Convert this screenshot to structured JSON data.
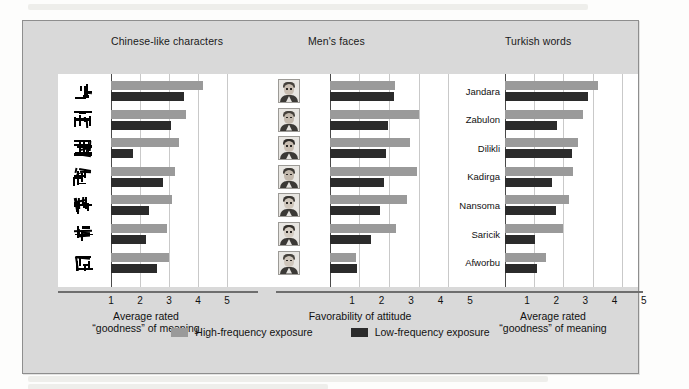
{
  "figure": {
    "colors": {
      "high_frequency": "#9a9a9a",
      "low_frequency": "#2b2b2b",
      "panel_background": "#ffffff",
      "frame_background": "#d9d9d9",
      "gridline": "#c9c9c9",
      "axis": "#6e6e6e"
    },
    "axis": {
      "ticks": [
        1,
        2,
        3,
        4,
        5
      ],
      "min": 1,
      "max": 5
    },
    "legend": {
      "items": [
        {
          "label": "High-frequency exposure",
          "color": "#9a9a9a",
          "key": "high"
        },
        {
          "label": "Low-frequency exposure",
          "color": "#2b2b2b",
          "key": "low"
        }
      ]
    }
  },
  "chart_data": [
    {
      "type": "bar",
      "orientation": "horizontal",
      "title": "Chinese-like characters",
      "xlabel": "Average rated\n“goodness” of meaning",
      "xlabel_line1": "Average rated",
      "xlabel_line2": "“goodness” of meaning",
      "ylabel": "",
      "xlim": [
        1,
        5
      ],
      "xticks": [
        1,
        2,
        3,
        4,
        5
      ],
      "grid": true,
      "legend_position": "bottom-center",
      "categories": [
        "glyph-1",
        "glyph-2",
        "glyph-3",
        "glyph-4",
        "glyph-5",
        "glyph-6",
        "glyph-7"
      ],
      "category_kind": "glyph",
      "series": [
        {
          "name": "High-frequency exposure",
          "key": "high",
          "color": "#9a9a9a",
          "values": [
            4.18,
            3.6,
            3.33,
            3.19,
            3.1,
            2.94,
            3.0
          ]
        },
        {
          "name": "Low-frequency exposure",
          "key": "low",
          "color": "#2b2b2b",
          "values": [
            3.52,
            3.08,
            1.77,
            2.8,
            2.3,
            2.21,
            2.58
          ]
        }
      ]
    },
    {
      "type": "bar",
      "orientation": "horizontal",
      "title": "Men's faces",
      "xlabel": "Favorability of attitude",
      "xlabel_line1": "Favorability of attitude",
      "xlabel_line2": "",
      "ylabel": "",
      "xlim": [
        1,
        5
      ],
      "xticks": [
        1,
        2,
        3,
        4,
        5
      ],
      "grid": true,
      "legend_position": "bottom-center",
      "categories": [
        "face-1",
        "face-2",
        "face-3",
        "face-4",
        "face-5",
        "face-6",
        "face-7"
      ],
      "category_kind": "photo",
      "series": [
        {
          "name": "High-frequency exposure",
          "key": "high",
          "color": "#9a9a9a",
          "values": [
            3.22,
            4.03,
            3.7,
            3.94,
            3.62,
            3.25,
            1.88
          ]
        },
        {
          "name": "Low-frequency exposure",
          "key": "low",
          "color": "#2b2b2b",
          "values": [
            3.18,
            2.96,
            2.9,
            2.82,
            2.7,
            2.4,
            1.9
          ]
        }
      ]
    },
    {
      "type": "bar",
      "orientation": "horizontal",
      "title": "Turkish words",
      "xlabel": "Average rated\n“goodness” of meaning",
      "xlabel_line1": "Average rated",
      "xlabel_line2": "“goodness” of meaning",
      "ylabel": "",
      "xlim": [
        1,
        5
      ],
      "xticks": [
        1,
        2,
        3,
        4,
        5
      ],
      "grid": true,
      "legend_position": "bottom-center",
      "categories": [
        "Jandara",
        "Zabulon",
        "Dilikli",
        "Kadirga",
        "Nansoma",
        "Saricik",
        "Afworbu"
      ],
      "category_kind": "text",
      "series": [
        {
          "name": "High-frequency exposure",
          "key": "high",
          "color": "#9a9a9a",
          "values": [
            4.17,
            3.67,
            3.51,
            3.34,
            3.19,
            3.0,
            2.39
          ]
        },
        {
          "name": "Low-frequency exposure",
          "key": "low",
          "color": "#2b2b2b",
          "values": [
            3.84,
            2.79,
            3.31,
            2.62,
            2.73,
            2.03,
            2.08
          ]
        }
      ]
    }
  ]
}
